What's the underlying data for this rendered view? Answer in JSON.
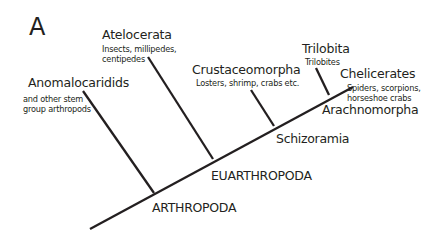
{
  "panel_label": "A",
  "colors": {
    "line": "#231f20",
    "text": "#231f20",
    "background": "#ffffff"
  },
  "taxa": [
    {
      "id": "anomalocaridids",
      "title": "Anomalocaridids",
      "description": [
        "and other stem",
        "group arthropods"
      ]
    },
    {
      "id": "atelocerata",
      "title": "Atelocerata",
      "description": [
        "Insects, millipedes,",
        "centipedes"
      ]
    },
    {
      "id": "crustaceomorpha",
      "title": "Crustaceomorpha",
      "description": [
        "Losters, shrimp, crabs etc."
      ]
    },
    {
      "id": "trilobita",
      "title": "Trilobita",
      "description": [
        "Trilobites"
      ]
    },
    {
      "id": "chelicerates",
      "title": "Chelicerates",
      "description": [
        "Spiders, scorpions,",
        "horseshoe crabs"
      ]
    }
  ],
  "clades": {
    "arthropoda": "ARTHROPODA",
    "euarthropoda": "EUARTHROPODA",
    "schizoramia": "Schizoramia",
    "arachnomorpha": "Arachnomorpha"
  },
  "tree": {
    "trunk": {
      "x1": 90,
      "y1": 229,
      "x2": 353,
      "y2": 87
    },
    "branches": [
      {
        "taxon": "anomalocaridids",
        "x1": 83,
        "y1": 91,
        "x2": 154,
        "y2": 193
      },
      {
        "taxon": "atelocerata",
        "x1": 148,
        "y1": 57,
        "x2": 213,
        "y2": 159
      },
      {
        "taxon": "crustaceomorpha",
        "x1": 251,
        "y1": 90,
        "x2": 274,
        "y2": 126
      },
      {
        "taxon": "trilobita",
        "x1": 316,
        "y1": 68,
        "x2": 329,
        "y2": 95
      }
    ]
  }
}
